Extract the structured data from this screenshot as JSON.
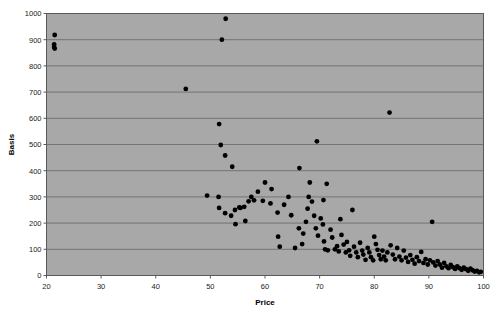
{
  "figure": {
    "background_color": "#ffffff",
    "plot_background_color": "#a8a8a8",
    "frame_color": "#5a5a5a",
    "gridline_color": "#6e6e6e",
    "marker_color": "#000000"
  },
  "chart_data": {
    "type": "scatter",
    "title": "",
    "xlabel": "Price",
    "ylabel": "Basis",
    "xlim": [
      20,
      100
    ],
    "ylim": [
      0,
      1000
    ],
    "xticks": [
      20,
      30,
      40,
      50,
      60,
      70,
      80,
      90,
      100
    ],
    "yticks": [
      0,
      100,
      200,
      300,
      400,
      500,
      600,
      700,
      800,
      900,
      1000
    ],
    "xtick_labels": [
      "20",
      "30",
      "40",
      "50",
      "60",
      "70",
      "80",
      "90",
      "100"
    ],
    "ytick_labels": [
      "0",
      "100",
      "200",
      "300",
      "400",
      "500",
      "600",
      "700",
      "800",
      "900",
      "1000"
    ],
    "grid": "horizontal",
    "legend": "none",
    "marker_size": 3,
    "points": [
      [
        21.5,
        918
      ],
      [
        21.4,
        882
      ],
      [
        21.4,
        872
      ],
      [
        21.5,
        866
      ],
      [
        52.8,
        980
      ],
      [
        52.1,
        900
      ],
      [
        45.5,
        712
      ],
      [
        51.6,
        578
      ],
      [
        51.9,
        498
      ],
      [
        52.7,
        458
      ],
      [
        54.0,
        415
      ],
      [
        49.4,
        305
      ],
      [
        51.5,
        300
      ],
      [
        51.6,
        258
      ],
      [
        52.7,
        238
      ],
      [
        53.8,
        228
      ],
      [
        54.5,
        250
      ],
      [
        55.3,
        260
      ],
      [
        55.5,
        258
      ],
      [
        56.2,
        262
      ],
      [
        57.5,
        300
      ],
      [
        57.0,
        283
      ],
      [
        58.0,
        287
      ],
      [
        58.7,
        320
      ],
      [
        59.6,
        285
      ],
      [
        60.0,
        355
      ],
      [
        56.4,
        208
      ],
      [
        54.6,
        196
      ],
      [
        61.0,
        275
      ],
      [
        61.2,
        330
      ],
      [
        62.3,
        240
      ],
      [
        62.4,
        148
      ],
      [
        62.7,
        110
      ],
      [
        63.5,
        270
      ],
      [
        64.3,
        300
      ],
      [
        64.8,
        230
      ],
      [
        66.3,
        410
      ],
      [
        66.2,
        180
      ],
      [
        67.0,
        160
      ],
      [
        67.8,
        255
      ],
      [
        68.0,
        300
      ],
      [
        68.6,
        282
      ],
      [
        69.0,
        228
      ],
      [
        69.3,
        180
      ],
      [
        69.7,
        152
      ],
      [
        70.2,
        218
      ],
      [
        70.6,
        195
      ],
      [
        70.8,
        130
      ],
      [
        71.0,
        100
      ],
      [
        71.5,
        96
      ],
      [
        72.0,
        175
      ],
      [
        72.3,
        145
      ],
      [
        72.8,
        100
      ],
      [
        73.2,
        112
      ],
      [
        73.5,
        92
      ],
      [
        74.0,
        155
      ],
      [
        74.4,
        118
      ],
      [
        74.8,
        88
      ],
      [
        75.0,
        128
      ],
      [
        75.4,
        96
      ],
      [
        75.6,
        75
      ],
      [
        76.0,
        250
      ],
      [
        76.3,
        110
      ],
      [
        76.7,
        88
      ],
      [
        77.0,
        70
      ],
      [
        77.4,
        125
      ],
      [
        77.8,
        95
      ],
      [
        78.0,
        80
      ],
      [
        78.4,
        60
      ],
      [
        78.8,
        105
      ],
      [
        79.1,
        88
      ],
      [
        79.4,
        70
      ],
      [
        79.8,
        58
      ],
      [
        71.3,
        350
      ],
      [
        70.7,
        288
      ],
      [
        69.5,
        512
      ],
      [
        68.2,
        355
      ],
      [
        80.0,
        148
      ],
      [
        80.3,
        120
      ],
      [
        80.6,
        98
      ],
      [
        80.9,
        78
      ],
      [
        81.2,
        62
      ],
      [
        81.5,
        95
      ],
      [
        81.8,
        72
      ],
      [
        82.1,
        58
      ],
      [
        82.4,
        88
      ],
      [
        82.8,
        622
      ],
      [
        83.0,
        115
      ],
      [
        83.4,
        80
      ],
      [
        83.8,
        62
      ],
      [
        84.2,
        105
      ],
      [
        84.6,
        72
      ],
      [
        85.0,
        58
      ],
      [
        85.4,
        95
      ],
      [
        85.8,
        68
      ],
      [
        86.2,
        52
      ],
      [
        86.6,
        78
      ],
      [
        87.0,
        60
      ],
      [
        87.4,
        45
      ],
      [
        87.8,
        70
      ],
      [
        88.2,
        55
      ],
      [
        88.6,
        90
      ],
      [
        89.0,
        48
      ],
      [
        89.4,
        62
      ],
      [
        89.8,
        42
      ],
      [
        90.2,
        58
      ],
      [
        90.6,
        205
      ],
      [
        90.8,
        50
      ],
      [
        91.2,
        38
      ],
      [
        91.6,
        55
      ],
      [
        92.0,
        42
      ],
      [
        92.4,
        30
      ],
      [
        92.8,
        48
      ],
      [
        93.2,
        35
      ],
      [
        93.6,
        28
      ],
      [
        94.0,
        40
      ],
      [
        94.4,
        32
      ],
      [
        94.8,
        25
      ],
      [
        95.2,
        35
      ],
      [
        95.6,
        28
      ],
      [
        96.0,
        22
      ],
      [
        96.4,
        30
      ],
      [
        96.8,
        24
      ],
      [
        97.2,
        18
      ],
      [
        97.6,
        26
      ],
      [
        98.0,
        20
      ],
      [
        98.4,
        15
      ],
      [
        98.8,
        18
      ],
      [
        99.2,
        12
      ],
      [
        99.5,
        14
      ],
      [
        73.8,
        215
      ],
      [
        67.5,
        205
      ],
      [
        66.8,
        120
      ],
      [
        65.5,
        105
      ]
    ]
  }
}
